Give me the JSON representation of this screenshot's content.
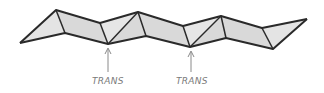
{
  "diagram": {
    "colors": {
      "fill": "#d9d9d9",
      "stroke": "#2a2a2a",
      "arrow": "#8a8a8a",
      "label": "#7a7a7a"
    },
    "markers": [
      {
        "label": "TRANS"
      },
      {
        "label": "TRANS"
      }
    ]
  }
}
